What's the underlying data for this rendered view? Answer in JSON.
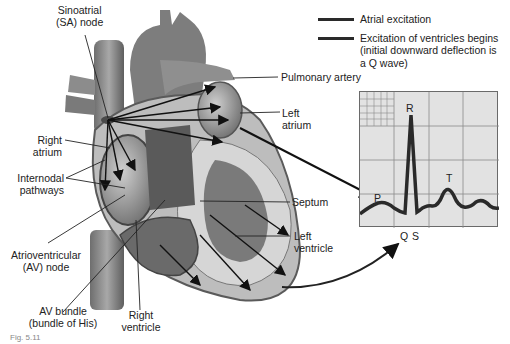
{
  "legend": {
    "items": [
      {
        "label": "Atrial excitation",
        "color": "#2a2a2a"
      },
      {
        "label": "Excitation of ventricles begins",
        "label_line2": "(initial downward deflection is",
        "label_line3": "a Q wave)",
        "color": "#3a3a3a"
      }
    ]
  },
  "labels": {
    "sa_node": {
      "line1": "Sinoatrial",
      "line2": "(SA) node"
    },
    "pulmonary_artery": "Pulmonary artery",
    "left_atrium": {
      "line1": "Left",
      "line2": "atrium"
    },
    "right_atrium": {
      "line1": "Right",
      "line2": "atrium"
    },
    "internodal": {
      "line1": "Internodal",
      "line2": "pathways"
    },
    "septum": "Septum",
    "left_ventricle": {
      "line1": "Left",
      "line2": "ventricle"
    },
    "av_node": {
      "line1": "Atrioventricular",
      "line2": "(AV) node"
    },
    "av_bundle": {
      "line1": "AV bundle",
      "line2": "(bundle of His)"
    },
    "right_ventricle": {
      "line1": "Right",
      "line2": "ventricle"
    },
    "figure_ref": "Fig. 5.11"
  },
  "ecg": {
    "waves": {
      "p": "P",
      "r": "R",
      "t": "T",
      "q": "Q",
      "s": "S"
    },
    "panel_color": "#e2e2e2",
    "grid_color": "#8a8a8a",
    "trace_color": "#2a2a2a"
  }
}
